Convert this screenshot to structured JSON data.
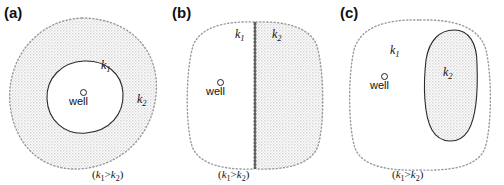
{
  "figure": {
    "width": 504,
    "height": 185,
    "background": "#ffffff",
    "stipple_color": "#d8d8d8",
    "line_color": "#1a1a1a",
    "dotted_color": "#9a9a9a"
  },
  "panels": [
    {
      "id": "a",
      "label": "(a)",
      "caption": "(k1>k2)",
      "caption_parts": {
        "open": "(",
        "k_left": "k",
        "sub_left": "1",
        "gt": ">",
        "k_right": "k",
        "sub_right": "2",
        "close": ")"
      },
      "outer_region": {
        "permeability_label": "k",
        "permeability_sub": "2",
        "boundary_style": "dotted",
        "fill": "stipple",
        "shape": "rounded-blob"
      },
      "inner_region": {
        "permeability_label": "k",
        "permeability_sub": "1",
        "boundary_style": "solid",
        "fill": "white",
        "shape": "rounded-blob"
      },
      "well": {
        "marker": "open-circle",
        "label": "well"
      },
      "description": "Well inside a high-permeability inner blob surrounded by lower-permeability shaded outer region"
    },
    {
      "id": "b",
      "label": "(b)",
      "caption": "(k1>k2)",
      "caption_parts": {
        "open": "(",
        "k_left": "k",
        "sub_left": "1",
        "gt": ">",
        "k_right": "k",
        "sub_right": "2",
        "close": ")"
      },
      "left_region": {
        "permeability_label": "k",
        "permeability_sub": "1",
        "boundary_style": "dotted",
        "fill": "white",
        "shape": "rounded-rect-half"
      },
      "right_region": {
        "permeability_label": "k",
        "permeability_sub": "2",
        "boundary_style": "dotted",
        "fill": "stipple",
        "shape": "rounded-rect-half"
      },
      "divider": {
        "style": "solid",
        "orientation": "vertical"
      },
      "well": {
        "marker": "open-circle",
        "label": "well"
      },
      "description": "Vertical linear contact splitting the domain; well sits in the high-permeability left half"
    },
    {
      "id": "c",
      "label": "(c)",
      "caption": "(k1>k2)",
      "caption_parts": {
        "open": "(",
        "k_left": "k",
        "sub_left": "1",
        "gt": ">",
        "k_right": "k",
        "sub_right": "2",
        "close": ")"
      },
      "outer_region": {
        "permeability_label": "k",
        "permeability_sub": "1",
        "boundary_style": "dotted",
        "fill": "white",
        "shape": "rounded-rect"
      },
      "inclusion_region": {
        "permeability_label": "k",
        "permeability_sub": "2",
        "boundary_style": "solid",
        "fill": "stipple",
        "shape": "elongated-oval"
      },
      "well": {
        "marker": "open-circle",
        "label": "well"
      },
      "description": "Well in a high-permeability matrix with an elongated low-permeability inclusion to the right"
    }
  ]
}
